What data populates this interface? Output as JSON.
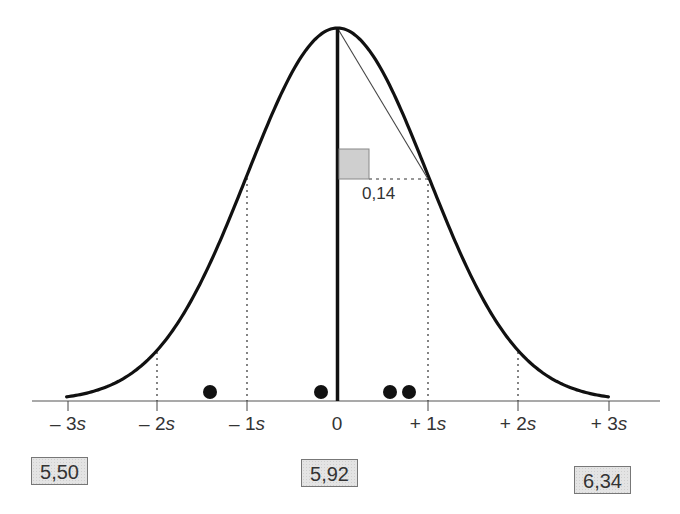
{
  "chart_data": {
    "type": "line",
    "title": "",
    "xlabel": "",
    "ylabel": "",
    "x_ticks": [
      "– 3s",
      "– 2s",
      "– 1s",
      "0",
      "+ 1s",
      "+ 2s",
      "+ 3s"
    ],
    "x_tick_sigma": [
      -3,
      -2,
      -1,
      0,
      1,
      2,
      3
    ],
    "xlim_sigma": [
      -3,
      3
    ],
    "grid": false,
    "curve": {
      "mean": 0,
      "sd": 1,
      "label": "normal density"
    },
    "sample_points_sigma": [
      -1.41,
      -0.18,
      0.59,
      0.8
    ],
    "slope_annotation": {
      "value": "0,14",
      "from_sigma": 0,
      "to_sigma": 1
    },
    "value_boxes": [
      {
        "position_sigma": -3,
        "value": "5,50"
      },
      {
        "position_sigma": 0,
        "value": "5,92"
      },
      {
        "position_sigma": 3,
        "value": "6,34"
      }
    ]
  },
  "labels": {
    "ticks": [
      {
        "sign": "– ",
        "num": "3",
        "unit": "s"
      },
      {
        "sign": "– ",
        "num": "2",
        "unit": "s"
      },
      {
        "sign": "– ",
        "num": "1",
        "unit": "s"
      },
      {
        "sign": "",
        "num": "0",
        "unit": ""
      },
      {
        "sign": "+ ",
        "num": "1",
        "unit": "s"
      },
      {
        "sign": "+ ",
        "num": "2",
        "unit": "s"
      },
      {
        "sign": "+ ",
        "num": "3",
        "unit": "s"
      }
    ],
    "slope": "0,14",
    "box_low": "5,50",
    "box_mid": "5,92",
    "box_high": "6,34"
  }
}
